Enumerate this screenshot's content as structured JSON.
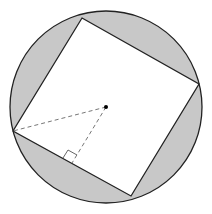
{
  "diagram": {
    "colors": {
      "segment_fill": "#c8c8c8",
      "stroke": "#222222",
      "dashed": "#777777",
      "square_fill": "#ffffff"
    },
    "circle": {
      "cx": 106,
      "cy": 107,
      "r": 96
    },
    "square": {
      "points": "82,18 199,84 131,196 13,131"
    },
    "center_point": {
      "cx": 106,
      "cy": 107
    },
    "dashed_to_vertex": {
      "x1": 106,
      "y1": 107,
      "x2": 13,
      "y2": 131
    },
    "dashed_to_midpoint": {
      "x1": 106,
      "y1": 107,
      "x2": 72,
      "y2": 163
    },
    "right_angle_marker": {
      "points": "63,158 68,150 77,155"
    }
  }
}
